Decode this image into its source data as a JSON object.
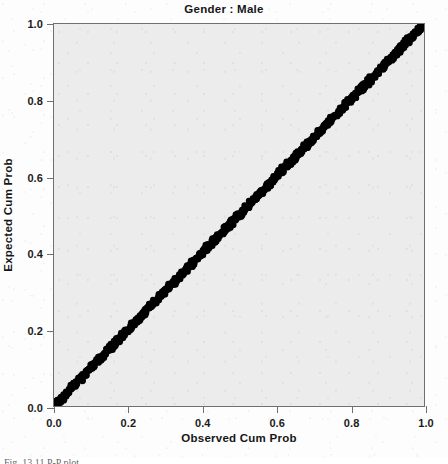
{
  "chart_data": {
    "type": "scatter",
    "title": "Gender : Male",
    "xlabel": "Observed Cum Prob",
    "ylabel": "Expected Cum Prob",
    "xlim": [
      0.0,
      1.0
    ],
    "ylim": [
      0.0,
      1.0
    ],
    "xticks": [
      "0.0",
      "0.2",
      "0.4",
      "0.6",
      "0.8",
      "1.0"
    ],
    "yticks": [
      "0.0",
      "0.2",
      "0.4",
      "0.6",
      "0.8",
      "1.0"
    ],
    "xtick_values": [
      0.0,
      0.2,
      0.4,
      0.6,
      0.8,
      1.0
    ],
    "ytick_values": [
      0.0,
      0.2,
      0.4,
      0.6,
      0.8,
      1.0
    ],
    "grid": false,
    "legend": "none",
    "plot_background": "#ececed",
    "point_color": "#000000",
    "x": [
      0.0,
      0.004,
      0.008,
      0.013,
      0.017,
      0.021,
      0.025,
      0.03,
      0.034,
      0.038,
      0.042,
      0.047,
      0.051,
      0.055,
      0.059,
      0.064,
      0.068,
      0.072,
      0.076,
      0.081,
      0.085,
      0.089,
      0.093,
      0.098,
      0.102,
      0.106,
      0.11,
      0.115,
      0.119,
      0.123,
      0.127,
      0.132,
      0.136,
      0.14,
      0.144,
      0.149,
      0.153,
      0.157,
      0.161,
      0.166,
      0.17,
      0.174,
      0.178,
      0.183,
      0.187,
      0.191,
      0.195,
      0.2,
      0.204,
      0.208,
      0.212,
      0.217,
      0.221,
      0.225,
      0.229,
      0.234,
      0.238,
      0.242,
      0.246,
      0.251,
      0.255,
      0.259,
      0.263,
      0.268,
      0.272,
      0.276,
      0.28,
      0.285,
      0.289,
      0.293,
      0.297,
      0.302,
      0.306,
      0.31,
      0.314,
      0.319,
      0.323,
      0.327,
      0.331,
      0.336,
      0.34,
      0.344,
      0.348,
      0.353,
      0.357,
      0.361,
      0.365,
      0.37,
      0.374,
      0.378,
      0.382,
      0.387,
      0.391,
      0.395,
      0.399,
      0.404,
      0.408,
      0.412,
      0.416,
      0.421,
      0.425,
      0.429,
      0.433,
      0.438,
      0.442,
      0.446,
      0.45,
      0.455,
      0.459,
      0.463,
      0.467,
      0.472,
      0.476,
      0.48,
      0.484,
      0.489,
      0.493,
      0.497,
      0.501,
      0.506,
      0.51,
      0.514,
      0.518,
      0.523,
      0.527,
      0.531,
      0.535,
      0.54,
      0.544,
      0.548,
      0.552,
      0.557,
      0.561,
      0.565,
      0.569,
      0.574,
      0.578,
      0.582,
      0.586,
      0.591,
      0.595,
      0.599,
      0.603,
      0.608,
      0.612,
      0.616,
      0.62,
      0.625,
      0.629,
      0.633,
      0.637,
      0.642,
      0.646,
      0.65,
      0.654,
      0.659,
      0.663,
      0.667,
      0.671,
      0.676,
      0.68,
      0.684,
      0.688,
      0.693,
      0.697,
      0.701,
      0.705,
      0.71,
      0.714,
      0.718,
      0.722,
      0.727,
      0.731,
      0.735,
      0.739,
      0.744,
      0.748,
      0.752,
      0.756,
      0.761,
      0.765,
      0.769,
      0.773,
      0.778,
      0.782,
      0.786,
      0.79,
      0.795,
      0.799,
      0.803,
      0.807,
      0.812,
      0.816,
      0.82,
      0.824,
      0.829,
      0.833,
      0.837,
      0.841,
      0.846,
      0.85,
      0.854,
      0.858,
      0.863,
      0.867,
      0.871,
      0.875,
      0.88,
      0.884,
      0.888,
      0.892,
      0.897,
      0.901,
      0.905,
      0.909,
      0.914,
      0.918,
      0.922,
      0.926,
      0.931,
      0.935,
      0.939,
      0.943,
      0.948,
      0.952,
      0.956,
      0.96,
      0.965,
      0.969,
      0.973,
      0.977,
      0.982,
      0.986,
      0.99,
      0.994,
      0.999,
      1.0
    ],
    "y": [
      0.0,
      0.005,
      0.009,
      0.012,
      0.018,
      0.02,
      0.026,
      0.029,
      0.035,
      0.037,
      0.043,
      0.046,
      0.05,
      0.056,
      0.058,
      0.063,
      0.069,
      0.071,
      0.077,
      0.08,
      0.084,
      0.09,
      0.092,
      0.097,
      0.103,
      0.105,
      0.111,
      0.114,
      0.118,
      0.124,
      0.126,
      0.131,
      0.137,
      0.139,
      0.145,
      0.148,
      0.152,
      0.158,
      0.16,
      0.165,
      0.171,
      0.173,
      0.179,
      0.182,
      0.186,
      0.192,
      0.194,
      0.199,
      0.205,
      0.207,
      0.213,
      0.216,
      0.22,
      0.226,
      0.228,
      0.233,
      0.239,
      0.241,
      0.247,
      0.25,
      0.254,
      0.26,
      0.262,
      0.267,
      0.273,
      0.275,
      0.281,
      0.284,
      0.288,
      0.294,
      0.296,
      0.301,
      0.307,
      0.309,
      0.315,
      0.318,
      0.322,
      0.328,
      0.33,
      0.335,
      0.341,
      0.343,
      0.349,
      0.352,
      0.356,
      0.362,
      0.364,
      0.369,
      0.375,
      0.377,
      0.383,
      0.386,
      0.39,
      0.396,
      0.398,
      0.403,
      0.409,
      0.411,
      0.417,
      0.42,
      0.424,
      0.43,
      0.432,
      0.437,
      0.443,
      0.445,
      0.451,
      0.454,
      0.458,
      0.464,
      0.466,
      0.471,
      0.477,
      0.479,
      0.485,
      0.488,
      0.492,
      0.498,
      0.5,
      0.505,
      0.511,
      0.513,
      0.519,
      0.522,
      0.526,
      0.532,
      0.534,
      0.539,
      0.545,
      0.547,
      0.553,
      0.556,
      0.56,
      0.566,
      0.568,
      0.573,
      0.579,
      0.581,
      0.587,
      0.59,
      0.594,
      0.6,
      0.602,
      0.607,
      0.613,
      0.615,
      0.621,
      0.624,
      0.628,
      0.634,
      0.636,
      0.641,
      0.647,
      0.649,
      0.655,
      0.658,
      0.662,
      0.668,
      0.67,
      0.675,
      0.681,
      0.683,
      0.689,
      0.692,
      0.696,
      0.702,
      0.704,
      0.709,
      0.715,
      0.717,
      0.723,
      0.726,
      0.73,
      0.736,
      0.738,
      0.743,
      0.749,
      0.751,
      0.757,
      0.76,
      0.764,
      0.77,
      0.772,
      0.777,
      0.783,
      0.785,
      0.791,
      0.794,
      0.798,
      0.804,
      0.806,
      0.811,
      0.817,
      0.819,
      0.825,
      0.828,
      0.832,
      0.838,
      0.84,
      0.845,
      0.851,
      0.853,
      0.859,
      0.862,
      0.866,
      0.872,
      0.874,
      0.879,
      0.885,
      0.887,
      0.893,
      0.896,
      0.9,
      0.906,
      0.908,
      0.913,
      0.919,
      0.921,
      0.927,
      0.93,
      0.934,
      0.94,
      0.942,
      0.947,
      0.953,
      0.955,
      0.961,
      0.964,
      0.968,
      0.974,
      0.976,
      0.981,
      0.987,
      0.989,
      0.995,
      0.998,
      1.0
    ]
  },
  "caption": {
    "text": "Fig. 13.11 P-P plot"
  },
  "bleed_through": [
    {
      "text": "Regression Standardized Residual",
      "x": 118,
      "y": 108,
      "size": 9,
      "rot": 0
    },
    {
      "text": "of the study for the same and  for entire cohort",
      "x": 70,
      "y": 178,
      "size": 9,
      "rot": 0
    },
    {
      "text": "Key and H. Herman",
      "x": 208,
      "y": 258,
      "size": 11,
      "rot": 0
    },
    {
      "text": "statistical considerations for the analysis of",
      "x": 66,
      "y": 300,
      "size": 9,
      "rot": 0
    },
    {
      "text": "data and the interpretation of results in the",
      "x": 66,
      "y": 316,
      "size": 9,
      "rot": 0
    },
    {
      "text": "J. Clin. Epidemiol. 54, 343-349",
      "x": 66,
      "y": 340,
      "size": 9,
      "rot": 0
    },
    {
      "text": "Multivariate Analysis, 6th edn.",
      "x": 66,
      "y": 356,
      "size": 9,
      "rot": 0
    },
    {
      "text": "Regression Analysis by Example",
      "x": 66,
      "y": 372,
      "size": 9,
      "rot": 0
    }
  ]
}
